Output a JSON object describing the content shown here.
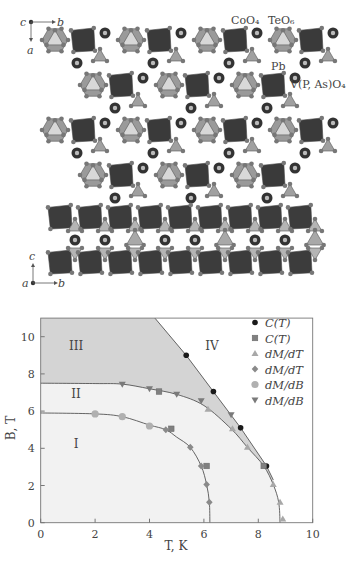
{
  "figure": {
    "top_panel": {
      "axes": {
        "origin": "c",
        "right": "b",
        "down": "a"
      },
      "labels": {
        "coo4": "CoO₄",
        "teo6": "TeO₆",
        "pb": "Pb",
        "vpaso4": "V(P, As)O₄"
      }
    },
    "middle_panel": {
      "axes": {
        "origin": "a",
        "right": "b",
        "up": "c"
      }
    }
  },
  "chart_data": {
    "type": "scatter",
    "title": "",
    "xlabel": "T, K",
    "ylabel": "B, T",
    "xlim": [
      0,
      10
    ],
    "ylim": [
      0,
      11
    ],
    "xticks": [
      "0",
      "2",
      "4",
      "6",
      "8",
      "10"
    ],
    "yticks": [
      "0",
      "2",
      "4",
      "6",
      "8",
      "10"
    ],
    "grid": false,
    "legend_position": "top-right",
    "regions": [
      {
        "label": "I",
        "x": 1.3,
        "y": 4.0
      },
      {
        "label": "II",
        "x": 1.3,
        "y": 6.7
      },
      {
        "label": "III",
        "x": 1.3,
        "y": 9.3
      },
      {
        "label": "IV",
        "x": 6.3,
        "y": 9.3
      }
    ],
    "phase_boundaries": [
      {
        "name": "I-II",
        "points": [
          [
            0,
            5.9
          ],
          [
            2,
            5.85
          ],
          [
            3,
            5.7
          ],
          [
            4,
            5.25
          ],
          [
            4.6,
            5.0
          ],
          [
            5.0,
            4.6
          ],
          [
            5.5,
            4.05
          ],
          [
            5.9,
            3.05
          ],
          [
            6.1,
            2.05
          ],
          [
            6.2,
            1.1
          ],
          [
            6.22,
            0
          ]
        ]
      },
      {
        "name": "II-III",
        "points": [
          [
            0,
            7.5
          ],
          [
            2,
            7.48
          ],
          [
            3,
            7.45
          ],
          [
            4,
            7.2
          ],
          [
            5,
            6.9
          ],
          [
            6,
            6.3
          ],
          [
            7,
            5.05
          ],
          [
            7.6,
            4.05
          ],
          [
            8.2,
            3.05
          ],
          [
            8.55,
            2.05
          ],
          [
            8.75,
            1.1
          ],
          [
            8.8,
            0
          ]
        ]
      },
      {
        "name": "III-IV",
        "points": [
          [
            4.2,
            11
          ],
          [
            5.35,
            9.0
          ],
          [
            6.35,
            7.05
          ],
          [
            7.35,
            5.1
          ],
          [
            8.3,
            3.05
          ],
          [
            8.55,
            2.3
          ]
        ]
      }
    ],
    "series": [
      {
        "name": "C(T)",
        "marker": "circle",
        "color": "#1a1a1a",
        "points": [
          [
            5.35,
            9.0
          ],
          [
            6.35,
            7.05
          ],
          [
            7.35,
            5.1
          ],
          [
            8.3,
            3.05
          ]
        ]
      },
      {
        "name": "C(T)",
        "marker": "square",
        "color": "#808080",
        "points": [
          [
            4.35,
            7.05
          ],
          [
            4.8,
            5.05
          ],
          [
            6.1,
            3.05
          ],
          [
            8.2,
            3.05
          ]
        ]
      },
      {
        "name": "dM/dT",
        "marker": "triangle-up",
        "color": "#a8a8a8",
        "points": [
          [
            6.15,
            6.1
          ],
          [
            7.05,
            5.05
          ],
          [
            7.6,
            4.05
          ],
          [
            8.55,
            2.05
          ],
          [
            8.8,
            1.1
          ],
          [
            8.9,
            0.2
          ]
        ]
      },
      {
        "name": "dM/dT",
        "marker": "diamond",
        "color": "#8a8a8a",
        "points": [
          [
            4.6,
            5.0
          ],
          [
            5.5,
            4.05
          ],
          [
            5.9,
            3.05
          ],
          [
            6.1,
            2.05
          ],
          [
            6.2,
            1.1
          ]
        ]
      },
      {
        "name": "dM/dB",
        "marker": "circle-large",
        "color": "#b0b0b0",
        "points": [
          [
            2.0,
            5.85
          ],
          [
            3.0,
            5.7
          ],
          [
            4.0,
            5.2
          ]
        ]
      },
      {
        "name": "dM/dB",
        "marker": "triangle-down",
        "color": "#7a7a7a",
        "points": [
          [
            3.0,
            7.45
          ],
          [
            4.0,
            7.2
          ],
          [
            5.0,
            6.9
          ],
          [
            5.9,
            6.55
          ],
          [
            7.0,
            5.8
          ]
        ]
      }
    ],
    "legend": [
      {
        "label": "C(T)",
        "marker": "circle"
      },
      {
        "label": "C(T)",
        "marker": "square"
      },
      {
        "label": "dM/dT",
        "marker": "triangle-up"
      },
      {
        "label": "dM/dT",
        "marker": "diamond"
      },
      {
        "label": "dM/dB",
        "marker": "circle-large"
      },
      {
        "label": "dM/dB",
        "marker": "triangle-down"
      }
    ],
    "colors": {
      "region_III": "#d4d4d4",
      "region_I_II": "#f2f2f2",
      "line": "#555555",
      "axis": "#777777"
    }
  }
}
